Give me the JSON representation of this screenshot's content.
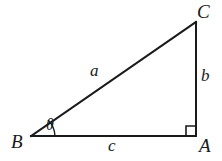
{
  "figure": {
    "kind": "right-triangle-diagram",
    "background_color": "#ffffff",
    "stroke_color": "#1a1a1a",
    "vertices": {
      "A": {
        "label": "A",
        "x": 196,
        "y": 136
      },
      "B": {
        "label": "B",
        "x": 31,
        "y": 136
      },
      "C": {
        "label": "C",
        "x": 196,
        "y": 22
      }
    },
    "sides": {
      "hypotenuse": {
        "label": "a",
        "from": "B",
        "to": "C"
      },
      "vertical": {
        "label": "b",
        "from": "A",
        "to": "C"
      },
      "base": {
        "label": "c",
        "from": "B",
        "to": "A"
      }
    },
    "angles": {
      "at_B": {
        "label": "θ",
        "marker": "arc"
      },
      "at_A": {
        "label": "",
        "marker": "right-angle-square"
      }
    }
  }
}
